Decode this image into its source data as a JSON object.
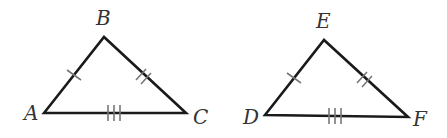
{
  "diagram": {
    "triangles": [
      {
        "name": "ABC",
        "vertices": [
          {
            "label": "A",
            "x": 44,
            "y": 113,
            "label_x": 24,
            "label_y": 120
          },
          {
            "label": "B",
            "x": 104,
            "y": 37,
            "label_x": 96,
            "label_y": 25
          },
          {
            "label": "C",
            "x": 186,
            "y": 113,
            "label_x": 193,
            "label_y": 124
          }
        ],
        "ticks": {
          "AB": 1,
          "BC": 2,
          "AC": 3
        }
      },
      {
        "name": "DEF",
        "vertices": [
          {
            "label": "D",
            "x": 265,
            "y": 115,
            "label_x": 243,
            "label_y": 124
          },
          {
            "label": "E",
            "x": 324,
            "y": 40,
            "label_x": 316,
            "label_y": 28
          },
          {
            "label": "F",
            "x": 408,
            "y": 117,
            "label_x": 413,
            "label_y": 126
          }
        ],
        "ticks": {
          "DE": 1,
          "EF": 2,
          "DF": 3
        }
      }
    ]
  }
}
